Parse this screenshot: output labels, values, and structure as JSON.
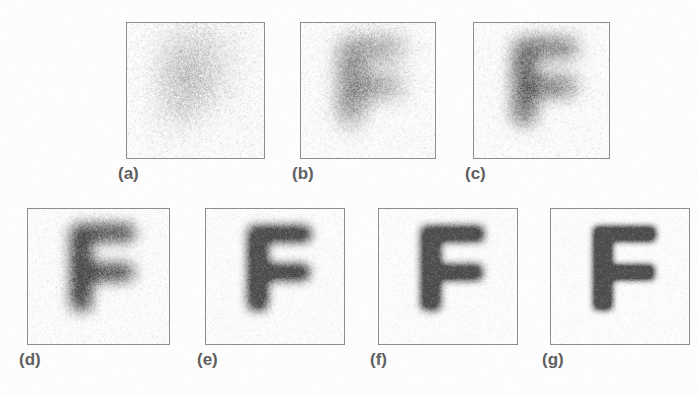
{
  "figure": {
    "kind": "image-restoration-sequence",
    "subject_glyph": "F",
    "background_color": "#fdfdfd",
    "panel_border_color": "#8d8d8d",
    "ink_color": "#4a4a4a",
    "label_color": "#5e5e5e",
    "panels": [
      {
        "id": "a",
        "label": "(a)",
        "x": 126,
        "y": 22,
        "width": 139,
        "height": 137,
        "label_x": 118,
        "label_y": 164,
        "blur": 17.0,
        "noise": 0.52,
        "contrast": 0.3,
        "glyph_scale": 0.86,
        "description": "heavily blurred, low-contrast F barely visible"
      },
      {
        "id": "b",
        "label": "(b)",
        "x": 300,
        "y": 22,
        "width": 136,
        "height": 137,
        "label_x": 292,
        "label_y": 164,
        "blur": 11.0,
        "noise": 0.44,
        "contrast": 0.46,
        "glyph_scale": 0.88,
        "description": "blurred F, vertical stem and upper bar emerging"
      },
      {
        "id": "c",
        "label": "(c)",
        "x": 473,
        "y": 22,
        "width": 137,
        "height": 137,
        "label_x": 465,
        "label_y": 164,
        "blur": 8.5,
        "noise": 0.4,
        "contrast": 0.56,
        "glyph_scale": 0.88,
        "description": "moderately blurred F, arms becoming distinct"
      },
      {
        "id": "d",
        "label": "(d)",
        "x": 27,
        "y": 208,
        "width": 143,
        "height": 137,
        "label_x": 19,
        "label_y": 350,
        "blur": 6.5,
        "noise": 0.34,
        "contrast": 0.66,
        "glyph_scale": 0.9,
        "description": "F readable, soft edges, residual grain"
      },
      {
        "id": "e",
        "label": "(e)",
        "x": 205,
        "y": 208,
        "width": 140,
        "height": 137,
        "label_x": 197,
        "label_y": 350,
        "blur": 4.6,
        "noise": 0.28,
        "contrast": 0.76,
        "glyph_scale": 0.88,
        "description": "clear F with slight blur"
      },
      {
        "id": "f",
        "label": "(f)",
        "x": 378,
        "y": 208,
        "width": 140,
        "height": 137,
        "label_x": 370,
        "label_y": 350,
        "blur": 3.6,
        "noise": 0.24,
        "contrast": 0.82,
        "glyph_scale": 0.88,
        "description": "sharper F, minimal noise"
      },
      {
        "id": "g",
        "label": "(g)",
        "x": 550,
        "y": 208,
        "width": 140,
        "height": 137,
        "label_x": 542,
        "label_y": 350,
        "blur": 2.9,
        "noise": 0.22,
        "contrast": 0.86,
        "glyph_scale": 0.88,
        "description": "sharpest F of the series"
      }
    ]
  }
}
